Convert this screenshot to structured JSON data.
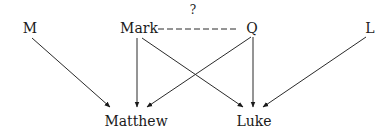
{
  "diagram": {
    "nodes": {
      "M": "M",
      "Mark": "Mark",
      "Q": "Q",
      "L": "L",
      "Matthew": "Matthew",
      "Luke": "Luke"
    },
    "uncertain_label": "?",
    "edges": [
      {
        "from": "M",
        "to": "Matthew"
      },
      {
        "from": "Mark",
        "to": "Matthew"
      },
      {
        "from": "Mark",
        "to": "Luke"
      },
      {
        "from": "Q",
        "to": "Matthew"
      },
      {
        "from": "Q",
        "to": "Luke"
      },
      {
        "from": "L",
        "to": "Luke"
      },
      {
        "from": "Mark",
        "to": "Q",
        "style": "dashed",
        "label": "?"
      }
    ]
  }
}
